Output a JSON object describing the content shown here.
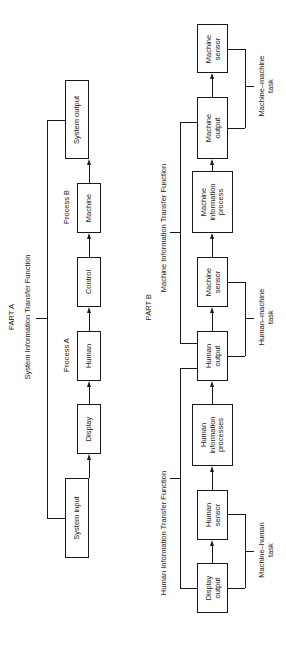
{
  "part_a": {
    "heading": "PART A",
    "function_title": "System Information Transfer Function",
    "process_a_label": "Process A",
    "process_b_label": "Process B",
    "boxes": {
      "system_input": "System input",
      "display": "Display",
      "human": "Human",
      "control": "Control",
      "machine": "Machine",
      "system_output": "System output"
    }
  },
  "part_b": {
    "heading": "PART B",
    "human_function_title": "Human Information Transfer Function",
    "machine_function_title": "Machine Information Transfer Function",
    "boxes": {
      "display_output": "Display\noutput",
      "human_sensor": "Human\nsensor",
      "human_info_processes": "Human\ninformation\nprocesses",
      "human_output": "Human\noutput",
      "machine_sensor_1": "Machine\nsensor",
      "machine_info_process": "Machine\ninformation\nprocess",
      "machine_output": "Machine\noutput",
      "machine_sensor_2": "Machine\nsensor"
    },
    "tasks": {
      "machine_human": "Machine–human\ntask",
      "human_machine": "Human–machine\ntask",
      "machine_machine": "Machine–machine\ntask"
    }
  }
}
